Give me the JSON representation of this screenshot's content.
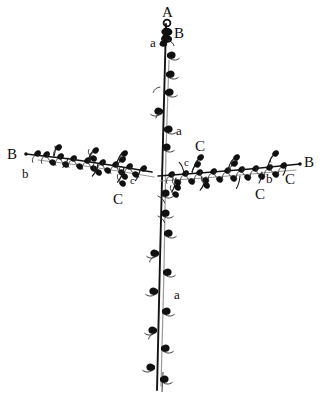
{
  "figure": {
    "background_color": "#ffffff",
    "ink_color": "#101010",
    "secondary_ink_color": "#8a8a8a",
    "width": 322,
    "height": 408
  },
  "labels": [
    {
      "id": "label-a-apex",
      "text": "A",
      "case": "upper",
      "x": 162,
      "y": 5,
      "note": "apex of main axis"
    },
    {
      "id": "label-b-apex-bud",
      "text": "B",
      "case": "upper",
      "x": 174,
      "y": 26,
      "note": "terminal bud region"
    },
    {
      "id": "label-a-lower-apex",
      "text": "a",
      "case": "lower",
      "x": 150,
      "y": 36,
      "note": "scale leaf near apex"
    },
    {
      "id": "label-a-upper-stem",
      "text": "a",
      "case": "lower",
      "x": 176,
      "y": 124,
      "note": "scale leaf on upper main axis"
    },
    {
      "id": "label-b-left-end",
      "text": "B",
      "case": "upper",
      "x": 7,
      "y": 147,
      "note": "tip of left lateral branch"
    },
    {
      "id": "label-b-left-lower",
      "text": "b",
      "case": "lower",
      "x": 22,
      "y": 167,
      "note": "bud on left lateral branch"
    },
    {
      "id": "label-c-right-upper",
      "text": "C",
      "case": "upper",
      "x": 195,
      "y": 139,
      "note": "branchlet above right lateral"
    },
    {
      "id": "label-c-right-small",
      "text": "c",
      "case": "small",
      "x": 184,
      "y": 157,
      "note": "small branchlet above right lateral"
    },
    {
      "id": "label-c-center-small",
      "text": "c",
      "case": "small",
      "x": 130,
      "y": 175,
      "note": "small branchlet below left lateral"
    },
    {
      "id": "label-c-center-lower",
      "text": "C",
      "case": "upper",
      "x": 113,
      "y": 192,
      "note": "branchlet below left lateral"
    },
    {
      "id": "label-c-right-lower",
      "text": "C",
      "case": "upper",
      "x": 255,
      "y": 187,
      "note": "branchlet below right lateral"
    },
    {
      "id": "label-b-right-lower",
      "text": "b",
      "case": "lower",
      "x": 266,
      "y": 172,
      "note": "bud on right lateral branch"
    },
    {
      "id": "label-c-right-end",
      "text": "C",
      "case": "upper",
      "x": 285,
      "y": 172,
      "note": "branchlet near right tip"
    },
    {
      "id": "label-b-right-end",
      "text": "B",
      "case": "upper",
      "x": 304,
      "y": 155,
      "note": "tip of right lateral branch"
    },
    {
      "id": "label-a-lower-stem",
      "text": "a",
      "case": "lower",
      "x": 174,
      "y": 288,
      "note": "scale leaf on lower main axis"
    }
  ],
  "structures": {
    "main_axis": {
      "name": "main-axis",
      "top_x": 166,
      "top_y": 22,
      "bottom_x": 157,
      "bottom_y": 392,
      "double_line": true
    },
    "left_branch": {
      "name": "left-lateral-branch",
      "start_x": 152,
      "start_y": 172,
      "end_x": 26,
      "end_y": 154
    },
    "right_branch": {
      "name": "right-lateral-branch",
      "start_x": 158,
      "start_y": 176,
      "end_x": 300,
      "end_y": 164
    }
  }
}
